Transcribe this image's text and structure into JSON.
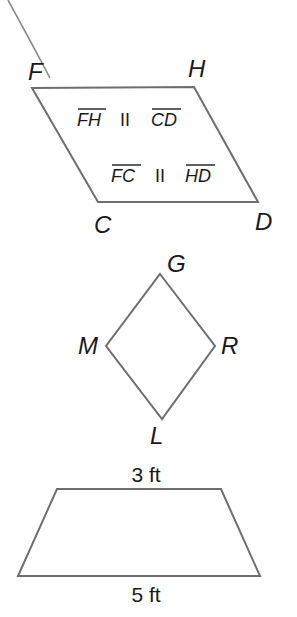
{
  "figures": {
    "parallelogram": {
      "vertices": {
        "F": "F",
        "H": "H",
        "C": "C",
        "D": "D"
      },
      "statement1": {
        "left": "FH",
        "symbol": "II",
        "right": "CD"
      },
      "statement2": {
        "left": "FC",
        "symbol": "II",
        "right": "HD"
      }
    },
    "rhombus": {
      "vertices": {
        "G": "G",
        "R": "R",
        "L": "L",
        "M": "M"
      }
    },
    "trapezoid": {
      "top_label": "3 ft",
      "bottom_label": "5 ft"
    }
  },
  "colors": {
    "stroke": "#6e6e6e",
    "text": "#1a1a1a",
    "background": "#ffffff"
  }
}
